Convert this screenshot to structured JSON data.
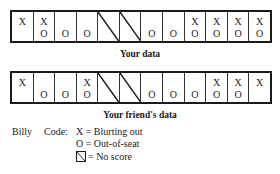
{
  "grids": [
    {
      "caption": "Your data",
      "cells": [
        {
          "top": "X",
          "bottom": ""
        },
        {
          "top": "X",
          "bottom": "O"
        },
        {
          "top": "",
          "bottom": "O"
        },
        {
          "top": "",
          "bottom": "O"
        },
        {
          "no_score": true
        },
        {
          "no_score": true
        },
        {
          "top": "",
          "bottom": "O"
        },
        {
          "top": "",
          "bottom": "O"
        },
        {
          "top": "X",
          "bottom": "O"
        },
        {
          "top": "X",
          "bottom": "O"
        },
        {
          "top": "X",
          "bottom": "O"
        },
        {
          "top": "X",
          "bottom": "O"
        }
      ]
    },
    {
      "caption": "Your friend's data",
      "cells": [
        {
          "top": "X",
          "bottom": ""
        },
        {
          "top": "",
          "bottom": "O"
        },
        {
          "top": "",
          "bottom": "O"
        },
        {
          "top": "X",
          "bottom": "O"
        },
        {
          "no_score": true
        },
        {
          "no_score": true
        },
        {
          "top": "",
          "bottom": "O"
        },
        {
          "top": "",
          "bottom": "O"
        },
        {
          "top": "",
          "bottom": "O"
        },
        {
          "top": "X",
          "bottom": "O"
        },
        {
          "top": "X",
          "bottom": "O"
        },
        {
          "top": "X",
          "bottom": ""
        }
      ]
    }
  ],
  "legend": {
    "student": "Billy",
    "code_label": "Code:",
    "entries": [
      {
        "symbol": "X",
        "text": "X = Blurting out"
      },
      {
        "symbol": "O",
        "text": "O = Out-of-seat"
      },
      {
        "symbol": "no-score-box",
        "text": "= No score"
      }
    ]
  }
}
